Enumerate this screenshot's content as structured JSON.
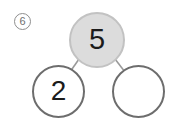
{
  "problem": {
    "number_label": "6"
  },
  "number_bond": {
    "whole": {
      "label": "whole-node",
      "value": "5",
      "filled": true,
      "fill_color": "#dcdcdc",
      "border_color": "#c2c2c2"
    },
    "parts": [
      {
        "label": "part-node-left",
        "value": "2",
        "filled": false,
        "fill_color": "#ffffff",
        "border_color": "#6d6d6d"
      },
      {
        "label": "part-node-right",
        "value": "",
        "filled": false,
        "fill_color": "#ffffff",
        "border_color": "#6d6d6d"
      }
    ],
    "connector_color": "#9a9a9a"
  },
  "colors": {
    "background": "#ffffff",
    "digit": "#1b1b1b",
    "problem_number": "#6f6f6f"
  }
}
